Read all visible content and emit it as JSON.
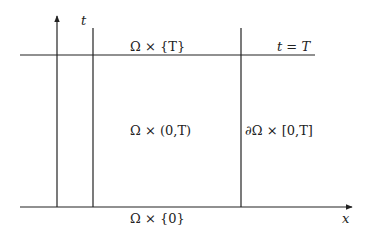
{
  "diagram": {
    "type": "space-time cylinder",
    "colors": {
      "line": "#222222",
      "background": "#ffffff"
    },
    "axes": {
      "t_label": "t",
      "x_label": "x"
    },
    "labels": {
      "top_boundary": "Ω × {T}",
      "time_line": "t = T",
      "interior": "Ω × (0,T)",
      "lateral_boundary": "∂Ω × [0,T]",
      "bottom_boundary": "Ω × {0}"
    }
  }
}
